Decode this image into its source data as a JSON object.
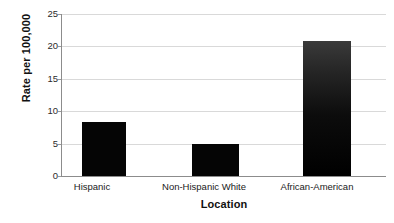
{
  "chart_data": {
    "type": "bar",
    "title": "",
    "categories": [
      "Hispanic",
      "Non-Hispanic White",
      "African-American"
    ],
    "values": [
      8.3,
      5.0,
      20.8
    ],
    "xlabel": "Location",
    "ylabel": "Rate per 100,000",
    "ylim": [
      0,
      25
    ],
    "yticks": [
      0,
      5,
      10,
      15,
      20,
      25
    ],
    "ytick_labels": [
      "0",
      "5",
      "10",
      "15",
      "20",
      "25"
    ],
    "grid": "horizontal",
    "legend": "none",
    "bar_color": "#050505",
    "gridline_color": "#d9d9d9",
    "axis_color": "#8c8c8c",
    "background": "#ffffff"
  },
  "axis": {
    "y_title": "Rate per 100,000",
    "x_title": "Location",
    "ticks": [
      {
        "label": "25",
        "value": 25
      },
      {
        "label": "20",
        "value": 20
      },
      {
        "label": "15",
        "value": 15
      },
      {
        "label": "10",
        "value": 10
      },
      {
        "label": "5",
        "value": 5
      },
      {
        "label": "0",
        "value": 0
      }
    ]
  },
  "bars": [
    {
      "label": "Hispanic",
      "value": 8.3
    },
    {
      "label": "Non-Hispanic White",
      "value": 5.0
    },
    {
      "label": "African-American",
      "value": 20.8
    }
  ]
}
